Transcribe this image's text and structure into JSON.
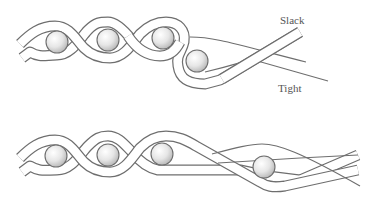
{
  "figure": {
    "top_panel": {
      "labels": {
        "slack": "Slack",
        "tight": "Tight"
      },
      "balls": [
        {
          "cx": 57,
          "cy": 42,
          "r": 11
        },
        {
          "cx": 108,
          "cy": 40,
          "r": 11
        },
        {
          "cx": 163,
          "cy": 38,
          "r": 11
        },
        {
          "cx": 197,
          "cy": 61,
          "r": 11
        }
      ]
    },
    "bottom_panel": {
      "balls": [
        {
          "cx": 56,
          "cy": 156,
          "r": 11
        },
        {
          "cx": 108,
          "cy": 155,
          "r": 11
        },
        {
          "cx": 162,
          "cy": 154,
          "r": 11
        },
        {
          "cx": 264,
          "cy": 167,
          "r": 11
        }
      ]
    },
    "colors": {
      "outline": "#6e6e6e",
      "fill": "#ffffff",
      "ball_highlight": "#ffffff",
      "ball_shadow": "#bdbdbd",
      "label": "#555555"
    }
  }
}
